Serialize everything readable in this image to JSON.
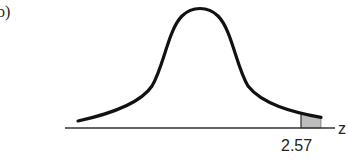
{
  "figure": {
    "part_label": "b)",
    "axis_variable": "z",
    "critical_value": "2.57",
    "shaded_region": "right tail beyond z = 2.57",
    "colors": {
      "curve": "#111111",
      "axis": "#333333",
      "shade": "#bbbbbb"
    }
  }
}
